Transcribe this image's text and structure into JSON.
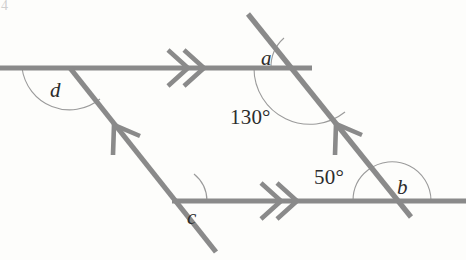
{
  "figure": {
    "background_color": "#fdfdfb",
    "stroke_color": "#8a8a8a",
    "arc_color": "#9a9a9a",
    "text_color": "#2c2c2c",
    "canvas": {
      "width": 466,
      "height": 260
    }
  },
  "vertices": {
    "top_left": {
      "name": "D",
      "x": 70,
      "y": 68
    },
    "top_right": {
      "name": "A",
      "x": 310,
      "y": 68
    },
    "bottom_left": {
      "name": "C",
      "x": 172,
      "y": 201
    },
    "bottom_right": {
      "name": "B",
      "x": 392,
      "y": 201
    }
  },
  "lines": [
    {
      "id": "top-parallel-line",
      "kind": "horizontal",
      "x1": 0,
      "y1": 68,
      "x2": 312,
      "y2": 68,
      "tick_marks": 2,
      "tick_style": "double-chevron-right",
      "tick_x": 185,
      "tick_y": 68
    },
    {
      "id": "bottom-parallel-line",
      "kind": "horizontal",
      "x1": 172,
      "y1": 201,
      "x2": 466,
      "y2": 201,
      "tick_marks": 2,
      "tick_style": "double-chevron-right",
      "tick_x": 278,
      "tick_y": 201
    },
    {
      "id": "left-transversal-line",
      "kind": "slanted",
      "x1": 70,
      "y1": 68,
      "x2": 216,
      "y2": 252,
      "tick_marks": 1,
      "tick_style": "single-chevron-up-left",
      "tick_x": 118,
      "tick_y": 129
    },
    {
      "id": "right-transversal-line",
      "kind": "slanted",
      "x1": 248,
      "y1": 14,
      "x2": 411,
      "y2": 217,
      "tick_marks": 1,
      "tick_style": "single-chevron-up-left",
      "tick_x": 339,
      "tick_y": 128
    }
  ],
  "labels": [
    {
      "id": "angle-a",
      "text": "a",
      "style": "variable",
      "x": 261,
      "y": 48,
      "vertex": "top_right"
    },
    {
      "id": "angle-b",
      "text": "b",
      "style": "variable",
      "x": 397,
      "y": 177,
      "vertex": "bottom_right"
    },
    {
      "id": "angle-c",
      "text": "c",
      "style": "variable",
      "x": 187,
      "y": 207,
      "vertex": "bottom_left"
    },
    {
      "id": "angle-d",
      "text": "d",
      "style": "variable",
      "x": 50,
      "y": 80,
      "vertex": "top_left"
    },
    {
      "id": "angle-130",
      "text": "130°",
      "style": "measure",
      "x": 230,
      "y": 107,
      "vertex": "top_right"
    },
    {
      "id": "angle-50",
      "text": "50°",
      "style": "measure",
      "x": 314,
      "y": 167,
      "vertex": "bottom_right"
    }
  ],
  "arcs": [
    {
      "id": "arc-a",
      "for": "a",
      "cx": 310,
      "cy": 68,
      "r": 39,
      "start_deg": 180,
      "end_deg": 230,
      "description": "small arc above top line at right vertex"
    },
    {
      "id": "arc-130",
      "for": "130",
      "cx": 310,
      "cy": 68,
      "r": 56,
      "start_deg": 180,
      "end_deg": 51,
      "description": "large reflex-side arc below top line at right vertex"
    },
    {
      "id": "arc-b",
      "for": "b",
      "cx": 392,
      "cy": 201,
      "r": 39,
      "start_deg": 231,
      "end_deg": 360,
      "description": "arc right of transversal at bottom right vertex"
    },
    {
      "id": "arc-50",
      "for": "50",
      "cx": 392,
      "cy": 201,
      "r": 39,
      "start_deg": 180,
      "end_deg": 231,
      "description": "arc left of transversal at bottom right vertex"
    },
    {
      "id": "arc-c",
      "for": "c",
      "cx": 172,
      "cy": 201,
      "r": 35,
      "start_deg": 0,
      "end_deg": 51,
      "description": "arc between bottom line and left transversal"
    },
    {
      "id": "arc-d",
      "for": "d",
      "cx": 70,
      "cy": 68,
      "r": 48,
      "start_deg": 180,
      "end_deg": 51,
      "description": "arc between left part of top line and left transversal"
    }
  ],
  "corner_marker": {
    "text": "4",
    "x": 2,
    "y": 2
  }
}
